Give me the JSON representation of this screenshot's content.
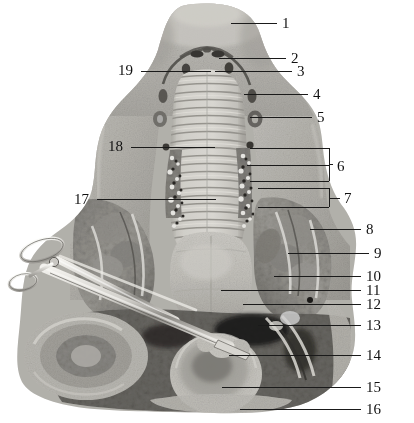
{
  "figure": {
    "image_type": "grayscale-anatomical-photograph",
    "width": 414,
    "height": 423,
    "background_color": "#ffffff",
    "leader_line_color": "#1a1a1a",
    "label_text_color": "#111111"
  },
  "labels": {
    "right": [
      {
        "id": "1",
        "text": "1",
        "num_x": 282,
        "num_y": 16,
        "line_x1": 231,
        "line_x2": 277,
        "line_y": 23
      },
      {
        "id": "2",
        "text": "2",
        "num_x": 291,
        "num_y": 51,
        "line_x1": 219,
        "line_x2": 286,
        "line_y": 58
      },
      {
        "id": "3",
        "text": "3",
        "num_x": 297,
        "num_y": 64,
        "line_x1": 215,
        "line_x2": 292,
        "line_y": 71
      },
      {
        "id": "4",
        "text": "4",
        "num_x": 313,
        "num_y": 87,
        "line_x1": 244,
        "line_x2": 308,
        "line_y": 94
      },
      {
        "id": "5",
        "text": "5",
        "num_x": 317,
        "num_y": 110,
        "line_x1": 250,
        "line_x2": 312,
        "line_y": 117
      },
      {
        "id": "8",
        "text": "8",
        "num_x": 366,
        "num_y": 222,
        "line_x1": 310,
        "line_x2": 361,
        "line_y": 229
      },
      {
        "id": "9",
        "text": "9",
        "num_x": 374,
        "num_y": 246,
        "line_x1": 288,
        "line_x2": 369,
        "line_y": 253
      },
      {
        "id": "10",
        "text": "10",
        "num_x": 366,
        "num_y": 269,
        "line_x1": 274,
        "line_x2": 361,
        "line_y": 276
      },
      {
        "id": "11",
        "text": "11",
        "num_x": 366,
        "num_y": 283,
        "line_x1": 221,
        "line_x2": 361,
        "line_y": 290
      },
      {
        "id": "12",
        "text": "12",
        "num_x": 366,
        "num_y": 297,
        "line_x1": 243,
        "line_x2": 361,
        "line_y": 304
      },
      {
        "id": "13",
        "text": "13",
        "num_x": 366,
        "num_y": 318,
        "line_x1": 258,
        "line_x2": 361,
        "line_y": 325
      },
      {
        "id": "14",
        "text": "14",
        "num_x": 366,
        "num_y": 348,
        "line_x1": 229,
        "line_x2": 361,
        "line_y": 355
      },
      {
        "id": "15",
        "text": "15",
        "num_x": 366,
        "num_y": 380,
        "line_x1": 222,
        "line_x2": 361,
        "line_y": 387
      },
      {
        "id": "16",
        "text": "16",
        "num_x": 366,
        "num_y": 402,
        "line_x1": 240,
        "line_x2": 361,
        "line_y": 409
      }
    ],
    "left": [
      {
        "id": "19",
        "text": "19",
        "num_x": 118,
        "num_y": 63,
        "line_x1": 141,
        "line_x2": 211,
        "line_y": 71
      },
      {
        "id": "18",
        "text": "18",
        "num_x": 108,
        "num_y": 139,
        "line_x1": 131,
        "line_x2": 215,
        "line_y": 147
      },
      {
        "id": "17",
        "text": "17",
        "num_x": 74,
        "num_y": 192,
        "line_x1": 97,
        "line_x2": 216,
        "line_y": 199
      }
    ],
    "brackets": [
      {
        "id": "6",
        "text": "6",
        "num_x": 337,
        "num_y": 159,
        "bar_x": 329,
        "bar_y1": 148,
        "bar_y2": 181,
        "stem_y": 164,
        "stem_x1": 329,
        "stem_x2": 333,
        "arms": [
          {
            "y": 148,
            "x1": 250,
            "x2": 329
          },
          {
            "y": 165,
            "x1": 247,
            "x2": 329
          },
          {
            "y": 181,
            "x1": 250,
            "x2": 329
          }
        ]
      },
      {
        "id": "7",
        "text": "7",
        "num_x": 344,
        "num_y": 191,
        "bar_x": 329,
        "bar_y1": 188,
        "bar_y2": 207,
        "stem_y": 198,
        "stem_x1": 329,
        "stem_x2": 340,
        "arms": [
          {
            "y": 188,
            "x1": 258,
            "x2": 329
          },
          {
            "y": 207,
            "x1": 258,
            "x2": 329
          }
        ]
      }
    ]
  },
  "instrument": {
    "name": "surgical-scissors",
    "description": "metal scissors / hemostat laid diagonally across the lower-left of the specimen"
  }
}
